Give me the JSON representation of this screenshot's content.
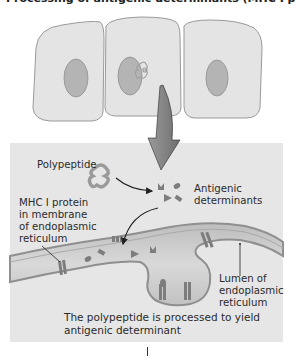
{
  "figure": {
    "title": "Processing of antigenic determinants (MHC I pathway)",
    "cells_count": 3,
    "labels": {
      "polypeptide": "Polypeptide",
      "antigenic_determinants": [
        "Antigenic",
        "determinants"
      ],
      "mhc_protein": [
        "MHC I protein",
        "in membrane",
        "of endoplasmic",
        "reticulum"
      ],
      "lumen": [
        "Lumen of",
        "endoplasmic",
        "reticulum"
      ]
    },
    "caption": [
      "The polypeptide is processed to yield",
      "antigenic determinant"
    ],
    "colors": {
      "panel": "#e6e6e6",
      "cell_fill": "#e4e4e4",
      "cell_outline": "#9a9a9a",
      "nucleus": "#b4b4b4",
      "er_membrane": "#8f8f8f",
      "er_lumen": "#d2d2d2",
      "protein": "#7d7d7d",
      "arrow": "#222222"
    }
  }
}
